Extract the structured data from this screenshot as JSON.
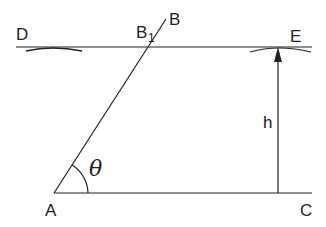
{
  "diagram": {
    "type": "geometry",
    "colors": {
      "stroke": "#222222",
      "background": "#ffffff"
    },
    "labels": {
      "D": "D",
      "B1_main": "B",
      "B1_sub": "1",
      "B": "B",
      "E": "E",
      "h": "h",
      "theta": "θ",
      "A": "A",
      "C": "C"
    },
    "points": {
      "A": [
        54,
        193
      ],
      "C": [
        312,
        193
      ],
      "D": [
        16,
        47
      ],
      "E": [
        312,
        47
      ],
      "B1": [
        158,
        47
      ],
      "B": [
        166,
        20
      ]
    },
    "segments": [
      {
        "name": "top-line-DE",
        "from": "D",
        "to": "E"
      },
      {
        "name": "bottom-line-AC",
        "from": "A",
        "to": "C"
      },
      {
        "name": "slant-line-AB",
        "from": "A",
        "to": "B"
      },
      {
        "name": "height-arrow-h",
        "from": [
          278,
          193
        ],
        "to": [
          278,
          47
        ]
      }
    ]
  }
}
